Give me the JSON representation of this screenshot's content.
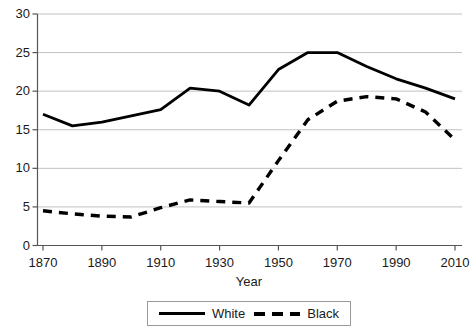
{
  "chart_data": {
    "type": "line",
    "title": "",
    "xlabel": "Year",
    "ylabel": "",
    "xlim": [
      1865,
      2015
    ],
    "ylim": [
      0,
      30
    ],
    "grid": true,
    "legend_position": "bottom",
    "xticks": [
      1870,
      1890,
      1910,
      1930,
      1950,
      1970,
      1990,
      2010
    ],
    "yticks": [
      0,
      5,
      10,
      15,
      20,
      25,
      30
    ],
    "x": [
      1870,
      1880,
      1890,
      1900,
      1910,
      1920,
      1930,
      1940,
      1950,
      1960,
      1970,
      1980,
      1990,
      2000,
      2010
    ],
    "series": [
      {
        "name": "White",
        "style": "solid",
        "color": "#000000",
        "values": [
          17.0,
          15.5,
          16.0,
          16.8,
          17.6,
          20.4,
          20.0,
          18.2,
          22.8,
          25.0,
          25.0,
          23.2,
          21.6,
          20.4,
          19.0
        ]
      },
      {
        "name": "Black",
        "style": "dashed",
        "color": "#000000",
        "values": [
          4.5,
          4.1,
          3.8,
          3.7,
          4.9,
          5.9,
          5.7,
          5.5,
          11.0,
          16.3,
          18.7,
          19.3,
          19.0,
          17.3,
          13.7
        ]
      }
    ]
  },
  "legend": {
    "entries": [
      {
        "label": "White",
        "style": "solid"
      },
      {
        "label": "Black",
        "style": "dashed"
      }
    ]
  },
  "axis_labels": {
    "x_title": "Year"
  }
}
